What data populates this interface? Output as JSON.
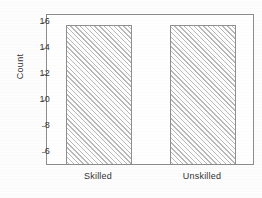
{
  "chart_data": {
    "type": "bar",
    "title": "",
    "subtitle": "",
    "xlabel": "",
    "ylabel": "Count",
    "categories": [
      "Skilled",
      "Unskilled"
    ],
    "values": [
      15.7,
      15.7
    ],
    "ylim": [
      5.0,
      16.6
    ],
    "yticks": [
      6,
      8,
      10,
      12,
      14,
      16
    ],
    "ytick_labels": [
      "6",
      "8",
      "10",
      "12",
      "14",
      "16"
    ],
    "grid": false,
    "legend": null,
    "series": [
      {
        "name": "Count",
        "values": [
          15.7,
          15.7
        ]
      }
    ],
    "style": {
      "bar_fill": "#e2e2e2",
      "bar_pattern": "diagonal-hatch",
      "bar_edge": "#8f8f8f",
      "frame": "#8d8d8d",
      "background": "#ffffff",
      "text": "#333333"
    }
  },
  "axes": {
    "y_label": "Count",
    "y_ticks": [
      {
        "value": 16,
        "label": "16"
      },
      {
        "value": 14,
        "label": "14"
      },
      {
        "value": 12,
        "label": "12"
      },
      {
        "value": 10,
        "label": "10"
      },
      {
        "value": 8,
        "label": "8"
      },
      {
        "value": 6,
        "label": "6"
      }
    ],
    "x_ticks": [
      {
        "label": "Skilled"
      },
      {
        "label": "Unskilled"
      }
    ]
  }
}
